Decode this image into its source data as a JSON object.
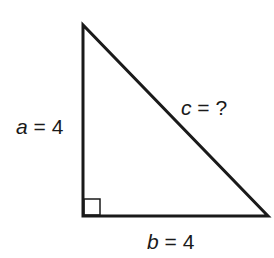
{
  "diagram": {
    "type": "right-triangle",
    "colors": {
      "stroke": "#1a1a1a",
      "background": "#ffffff"
    },
    "vertices": {
      "top": [
        83,
        25
      ],
      "right_angle": [
        83,
        216
      ],
      "bottom_right": [
        268,
        216
      ]
    },
    "right_angle_marker": true,
    "labels": {
      "a": {
        "variable": "a",
        "equals": " = ",
        "value": "4"
      },
      "b": {
        "variable": "b",
        "equals": " = ",
        "value": "4"
      },
      "c": {
        "variable": "c",
        "equals": " = ",
        "value": "?"
      }
    }
  }
}
